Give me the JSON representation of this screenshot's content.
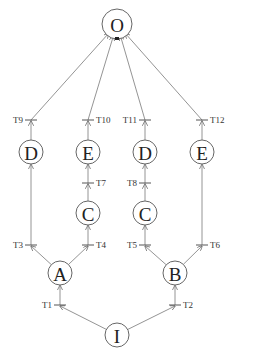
{
  "diagram": {
    "type": "petri-net-like tree",
    "nodes": [
      {
        "id": "O",
        "label": "O",
        "x": 117,
        "y": 24
      },
      {
        "id": "D1",
        "label": "D",
        "x": 31,
        "y": 152
      },
      {
        "id": "E1",
        "label": "E",
        "x": 88,
        "y": 152
      },
      {
        "id": "D2",
        "label": "D",
        "x": 145,
        "y": 152
      },
      {
        "id": "E2",
        "label": "E",
        "x": 202,
        "y": 152
      },
      {
        "id": "C1",
        "label": "C",
        "x": 88,
        "y": 213
      },
      {
        "id": "C2",
        "label": "C",
        "x": 145,
        "y": 213
      },
      {
        "id": "A",
        "label": "A",
        "x": 60,
        "y": 273
      },
      {
        "id": "B",
        "label": "B",
        "x": 175,
        "y": 273
      },
      {
        "id": "I",
        "label": "I",
        "x": 117,
        "y": 335
      }
    ],
    "transitions": [
      {
        "id": "T1",
        "label": "T1",
        "x": 60,
        "y": 305,
        "label_side": "left"
      },
      {
        "id": "T2",
        "label": "T2",
        "x": 175,
        "y": 305,
        "label_side": "right"
      },
      {
        "id": "T3",
        "label": "T3",
        "x": 31,
        "y": 245,
        "label_side": "left"
      },
      {
        "id": "T4",
        "label": "T4",
        "x": 88,
        "y": 245,
        "label_side": "right"
      },
      {
        "id": "T5",
        "label": "T5",
        "x": 145,
        "y": 245,
        "label_side": "left"
      },
      {
        "id": "T6",
        "label": "T6",
        "x": 202,
        "y": 245,
        "label_side": "right"
      },
      {
        "id": "T7",
        "label": "T7",
        "x": 88,
        "y": 183,
        "label_side": "right"
      },
      {
        "id": "T8",
        "label": "T8",
        "x": 145,
        "y": 183,
        "label_side": "left"
      },
      {
        "id": "T9",
        "label": "T9",
        "x": 31,
        "y": 120,
        "label_side": "left"
      },
      {
        "id": "T10",
        "label": "T10",
        "x": 88,
        "y": 120,
        "label_side": "right"
      },
      {
        "id": "T11",
        "label": "T11",
        "x": 145,
        "y": 120,
        "label_side": "left"
      },
      {
        "id": "T12",
        "label": "T12",
        "x": 202,
        "y": 120,
        "label_side": "right"
      }
    ],
    "edges": [
      {
        "from": "I",
        "via": "T1",
        "to": "A"
      },
      {
        "from": "I",
        "via": "T2",
        "to": "B"
      },
      {
        "from": "A",
        "via": "T3",
        "to": "D1"
      },
      {
        "from": "A",
        "via": "T4",
        "to": "C1"
      },
      {
        "from": "B",
        "via": "T5",
        "to": "C2"
      },
      {
        "from": "B",
        "via": "T6",
        "to": "E2"
      },
      {
        "from": "C1",
        "via": "T7",
        "to": "E1"
      },
      {
        "from": "C2",
        "via": "T8",
        "to": "D2"
      },
      {
        "from": "D1",
        "via": "T9",
        "to": "O"
      },
      {
        "from": "E1",
        "via": "T10",
        "to": "O"
      },
      {
        "from": "D2",
        "via": "T11",
        "to": "O"
      },
      {
        "from": "E2",
        "via": "T12",
        "to": "O"
      }
    ],
    "colors": {
      "stroke": "#888888",
      "text": "#222222",
      "background": "#ffffff"
    }
  }
}
